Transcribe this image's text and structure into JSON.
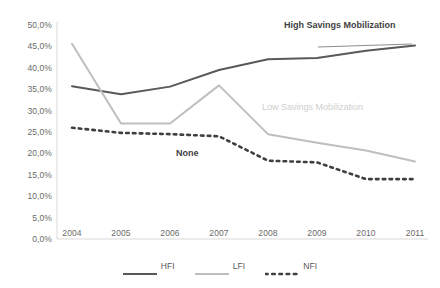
{
  "chart_data": {
    "type": "line",
    "title": "",
    "xlabel": "",
    "ylabel": "",
    "categories": [
      "2004",
      "2005",
      "2006",
      "2007",
      "2008",
      "2009",
      "2010",
      "2011"
    ],
    "x": [
      2004,
      2005,
      2006,
      2007,
      2008,
      2009,
      2010,
      2011
    ],
    "ylim": [
      0,
      50
    ],
    "ytick_values": [
      0,
      5,
      10,
      15,
      20,
      25,
      30,
      35,
      40,
      45,
      50
    ],
    "ytick_labels": [
      "0,0%",
      "5,0%",
      "10,0%",
      "15,0%",
      "20,0%",
      "25,0%",
      "30,0%",
      "35,0%",
      "40,0%",
      "45,0%",
      "50,0%"
    ],
    "grid": false,
    "legend_position": "bottom",
    "series": [
      {
        "name": "HFI",
        "values": [
          35.7,
          33.8,
          35.6,
          39.5,
          42.0,
          42.3,
          44.0,
          45.2
        ],
        "color": "#595959",
        "style": "solid",
        "width": 2
      },
      {
        "name": "LFI",
        "values": [
          45.6,
          27.0,
          27.0,
          35.9,
          24.5,
          22.5,
          20.7,
          18.1
        ],
        "color": "#bfbfbf",
        "style": "solid",
        "width": 2
      },
      {
        "name": "NFI",
        "values": [
          26.0,
          24.8,
          24.5,
          24.0,
          18.3,
          17.9,
          14.0,
          14.0
        ],
        "color": "#3f3f3f",
        "style": "dotted",
        "width": 2.6
      }
    ],
    "annotations": [
      {
        "text": "High Savings Mobilization",
        "series": "HFI"
      },
      {
        "text": "Low Savings Mobilization",
        "series": "LFI"
      },
      {
        "text": "None",
        "series": "NFI"
      }
    ]
  },
  "legend": {
    "items": [
      {
        "label": "HFI"
      },
      {
        "label": "LFI"
      },
      {
        "label": "NFI"
      }
    ]
  }
}
